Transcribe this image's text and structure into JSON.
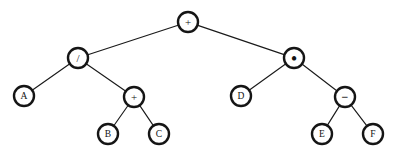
{
  "figure": {
    "name": "binary-expression-tree",
    "width": 398,
    "height": 156,
    "background_color": "#ffffff",
    "node_stroke_color": "#151515",
    "node_fill_color": "#ffffff",
    "edge_color": "#1a1a1a",
    "node_radius": 10
  },
  "nodes": [
    {
      "id": "n0",
      "label": "+",
      "kind": "operator",
      "op": "plus",
      "x": 188,
      "y": 22,
      "r": 10
    },
    {
      "id": "n1",
      "label": "/",
      "kind": "operator",
      "op": "div",
      "x": 78,
      "y": 58,
      "r": 10
    },
    {
      "id": "n2",
      "label": "•",
      "kind": "operator",
      "op": "mul",
      "x": 294,
      "y": 58,
      "r": 10
    },
    {
      "id": "n3",
      "label": "A",
      "kind": "operand",
      "op": "",
      "x": 24,
      "y": 96,
      "r": 10
    },
    {
      "id": "n4",
      "label": "+",
      "kind": "operator",
      "op": "plus",
      "x": 134,
      "y": 97,
      "r": 10
    },
    {
      "id": "n5",
      "label": "D",
      "kind": "operand",
      "op": "",
      "x": 241,
      "y": 96,
      "r": 10
    },
    {
      "id": "n6",
      "label": "−",
      "kind": "operator",
      "op": "minus",
      "x": 345,
      "y": 97,
      "r": 10
    },
    {
      "id": "n7",
      "label": "B",
      "kind": "operand",
      "op": "",
      "x": 108,
      "y": 134,
      "r": 10
    },
    {
      "id": "n8",
      "label": "C",
      "kind": "operand",
      "op": "",
      "x": 159,
      "y": 134,
      "r": 10
    },
    {
      "id": "n9",
      "label": "E",
      "kind": "operand",
      "op": "",
      "x": 322,
      "y": 134,
      "r": 10
    },
    {
      "id": "n10",
      "label": "F",
      "kind": "operand",
      "op": "",
      "x": 373,
      "y": 134,
      "r": 10
    }
  ],
  "edges": [
    {
      "from": "n0",
      "to": "n1"
    },
    {
      "from": "n0",
      "to": "n2"
    },
    {
      "from": "n1",
      "to": "n3"
    },
    {
      "from": "n1",
      "to": "n4"
    },
    {
      "from": "n2",
      "to": "n5"
    },
    {
      "from": "n2",
      "to": "n6"
    },
    {
      "from": "n4",
      "to": "n7"
    },
    {
      "from": "n4",
      "to": "n8"
    },
    {
      "from": "n6",
      "to": "n9"
    },
    {
      "from": "n6",
      "to": "n10"
    }
  ]
}
